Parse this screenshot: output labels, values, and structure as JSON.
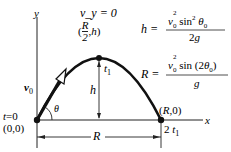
{
  "diagram": {
    "axes": {
      "x_label": "x",
      "y_label": "y"
    },
    "origin": {
      "coord_label": "(0,0)",
      "time_label": "t = 0"
    },
    "apex": {
      "condition_label": "v_y = 0",
      "coord_label": "(R/2, h)",
      "time_label": "t1"
    },
    "landing": {
      "coord_label": "(R,0)",
      "time_label": "2 t1"
    },
    "initial_velocity": {
      "label": "v0",
      "angle_label": "θ"
    },
    "dimensions": {
      "height_label": "h",
      "range_label": "R"
    },
    "equations": {
      "height": {
        "lhs": "h",
        "numerator": "v0² sin² θ0",
        "denominator": "2g"
      },
      "range": {
        "lhs": "R",
        "numerator": "v0² sin (2θ0)",
        "denominator": "g"
      }
    },
    "colors": {
      "ink": "#111111",
      "background": "#ffffff"
    }
  }
}
